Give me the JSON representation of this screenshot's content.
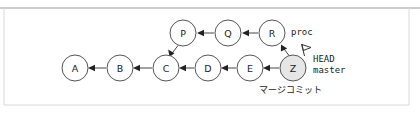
{
  "figure": {
    "background": "#ffffff",
    "frame": {
      "top_border_color": "#9a9a9a",
      "side_border_color": "#d8d8d8",
      "left": 4,
      "top": 8,
      "right": 409,
      "bottom": 105
    }
  },
  "graph": {
    "node_radius": 13,
    "node_fill": "#ffffff",
    "node_shaded_fill": "#e6e6e6",
    "node_stroke": "#555555",
    "edge_color": "#444444",
    "nodes": [
      {
        "id": "A",
        "label": "A",
        "cx": 75,
        "cy": 68,
        "shaded": false
      },
      {
        "id": "B",
        "label": "B",
        "cx": 120,
        "cy": 68,
        "shaded": false
      },
      {
        "id": "C",
        "label": "C",
        "cx": 166,
        "cy": 68,
        "shaded": false
      },
      {
        "id": "D",
        "label": "D",
        "cx": 208,
        "cy": 68,
        "shaded": false
      },
      {
        "id": "E",
        "label": "E",
        "cx": 250,
        "cy": 68,
        "shaded": false
      },
      {
        "id": "Z",
        "label": "Z",
        "cx": 293,
        "cy": 68,
        "shaded": true
      },
      {
        "id": "P",
        "label": "P",
        "cx": 183,
        "cy": 33,
        "shaded": false
      },
      {
        "id": "Q",
        "label": "Q",
        "cx": 228,
        "cy": 33,
        "shaded": false
      },
      {
        "id": "R",
        "label": "R",
        "cx": 272,
        "cy": 33,
        "shaded": false
      }
    ],
    "edges": [
      {
        "from": "B",
        "to": "A"
      },
      {
        "from": "C",
        "to": "B"
      },
      {
        "from": "D",
        "to": "C"
      },
      {
        "from": "E",
        "to": "D"
      },
      {
        "from": "Z",
        "to": "E"
      },
      {
        "from": "Q",
        "to": "P"
      },
      {
        "from": "R",
        "to": "Q"
      },
      {
        "from": "P",
        "to": "C"
      },
      {
        "from": "Z",
        "to": "R"
      }
    ]
  },
  "annotations": {
    "branch_proc": {
      "text": "proc",
      "x": 291,
      "y": 32
    },
    "head": {
      "text": "HEAD",
      "x": 313,
      "y": 59
    },
    "master": {
      "text": "master",
      "x": 313,
      "y": 70
    },
    "merge_commit_jp": {
      "text": "マージコミット",
      "x": 259,
      "y": 90
    },
    "head_flag": {
      "name": "head-flag-icon",
      "x": 305,
      "y": 46
    }
  }
}
